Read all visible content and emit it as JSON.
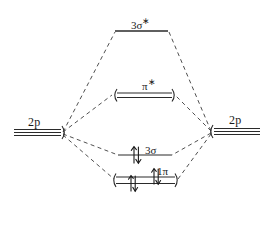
{
  "diagram": {
    "type": "molecular-orbital-diagram",
    "title": "",
    "background_color": "#ffffff",
    "ink_color": "#1a1a1a",
    "atomic_orbitals": {
      "left": {
        "label": "2p",
        "degeneracy": 3,
        "x_start": 14,
        "x_end": 62,
        "y": 133
      },
      "right": {
        "label": "2p",
        "degeneracy": 3,
        "x_start": 212,
        "x_end": 260,
        "y": 132
      }
    },
    "molecular_orbitals": [
      {
        "id": "sigma-3-star",
        "label_main": "3σ",
        "label_super": "∗",
        "full_label": "3σ*",
        "kind": "antibonding",
        "degeneracy": 1,
        "electrons": 0,
        "electron_pairs": [],
        "x_start": 115,
        "x_end": 168,
        "y": 31,
        "brackets": false
      },
      {
        "id": "pi-star",
        "label_main": "π",
        "label_super": "∗",
        "full_label": "π*",
        "kind": "antibonding",
        "degeneracy": 2,
        "electrons": 0,
        "electron_pairs": [],
        "x_start": 117,
        "x_end": 172,
        "y": 93,
        "brackets": true
      },
      {
        "id": "sigma-3",
        "label_main": "3σ",
        "label_super": "",
        "full_label": "3σ",
        "kind": "bonding",
        "degeneracy": 1,
        "electrons": 2,
        "electron_pairs": [
          {
            "x": 136,
            "y": 155
          }
        ],
        "x_start": 118,
        "x_end": 172,
        "y": 155,
        "brackets": false
      },
      {
        "id": "pi-1",
        "label_main": "1π",
        "label_super": "",
        "full_label": "1π",
        "kind": "bonding",
        "degeneracy": 2,
        "electrons": 4,
        "electron_pairs": [
          {
            "x": 133,
            "y": 183
          },
          {
            "x": 156,
            "y": 177
          }
        ],
        "x_start": 116,
        "x_end": 175,
        "y": 177,
        "brackets": true
      }
    ],
    "correlation_lines": [
      {
        "from": "left-2p",
        "to": "sigma-3-star"
      },
      {
        "from": "left-2p",
        "to": "pi-star"
      },
      {
        "from": "left-2p",
        "to": "sigma-3"
      },
      {
        "from": "left-2p",
        "to": "pi-1"
      },
      {
        "from": "right-2p",
        "to": "sigma-3-star"
      },
      {
        "from": "right-2p",
        "to": "pi-star"
      },
      {
        "from": "right-2p",
        "to": "sigma-3"
      },
      {
        "from": "right-2p",
        "to": "pi-1"
      }
    ]
  }
}
